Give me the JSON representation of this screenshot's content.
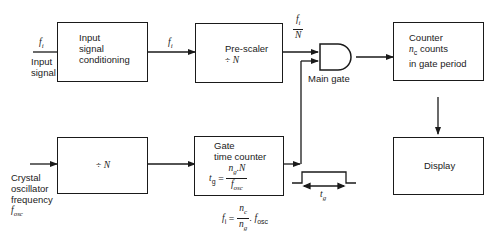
{
  "diagram": {
    "blocks": {
      "input_conditioning": {
        "lines": [
          "Input",
          "signal",
          "conditioning"
        ]
      },
      "prescaler": {
        "line1": "Pre-scaler",
        "line2_op": "÷",
        "line2_var": "N"
      },
      "counter": {
        "line1": "Counter",
        "line2_var": "n",
        "line2_sub": "c",
        "line2_rest": " counts",
        "line3": "in gate period"
      },
      "divider": {
        "op": "÷",
        "var": "N"
      },
      "gate_time_counter": {
        "line1": "Gate",
        "line2": "time counter",
        "formula": {
          "lhs": "t",
          "lhs_sub": "g",
          "eq": "=",
          "num": "n",
          "num_sub": "g",
          "num_rest": "N",
          "den": "f",
          "den_sub": "osc"
        }
      },
      "display": {
        "label": "Display"
      }
    },
    "gate": {
      "label": "Main gate"
    },
    "signals": {
      "input_fi": {
        "var": "f",
        "sub": "i"
      },
      "input_label": [
        "Input",
        "signal"
      ],
      "conditioned_fi": {
        "var": "f",
        "sub": "i"
      },
      "prescaled": {
        "num": "f",
        "num_sub": "i",
        "den": "N"
      },
      "oscillator_label": [
        "Crystal",
        "oscillator",
        "frequency"
      ],
      "oscillator_var": {
        "var": "f",
        "sub": "osc"
      },
      "pulse_width": {
        "var": "t",
        "sub": "g"
      }
    },
    "equation": {
      "lhs": "f",
      "lhs_sub": "i",
      "eq": "=",
      "num": "n",
      "num_sub": "c",
      "den": "n",
      "den_sub": "g",
      "dot": ".",
      "rhs": "f",
      "rhs_sub": "osc"
    }
  }
}
